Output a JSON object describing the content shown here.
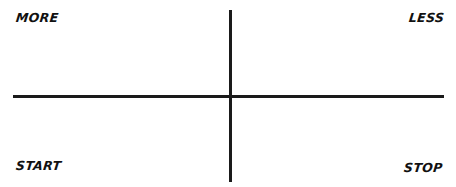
{
  "diagram": {
    "type": "four-quadrant-retrospective",
    "quadrants": {
      "top_left": {
        "label": "MORE"
      },
      "top_right": {
        "label": "LESS"
      },
      "bottom_left": {
        "label": "START"
      },
      "bottom_right": {
        "label": "STOP"
      }
    },
    "axes": {
      "color": "#1a1a1a",
      "horizontal": {
        "y": 96,
        "x_start": 13,
        "x_end": 444
      },
      "vertical": {
        "x": 230,
        "y_start": 10,
        "y_end": 182
      }
    },
    "background_color": "#ffffff",
    "text_color": "#111111"
  }
}
